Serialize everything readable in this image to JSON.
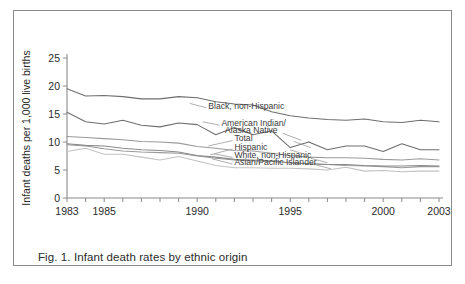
{
  "figure": {
    "caption": "Fig. 1. Infant death rates by ethnic origin",
    "border_color": "#8a8a8a"
  },
  "chart_data": {
    "type": "line",
    "title": "",
    "xlabel": "",
    "ylabel": "Infant deaths per 1,000 live births",
    "xlim": [
      1983,
      2003
    ],
    "ylim": [
      0,
      25
    ],
    "grid": false,
    "legend": "inline-labels",
    "y_ticks": [
      0,
      5,
      10,
      15,
      20,
      25
    ],
    "x_ticks": [
      1983,
      1984,
      1985,
      1986,
      1987,
      1988,
      1989,
      1990,
      1991,
      1992,
      1993,
      1994,
      1995,
      1996,
      1997,
      1998,
      1999,
      2000,
      2001,
      2002,
      2003
    ],
    "x_tick_labels": [
      "1983",
      "",
      "1985",
      "",
      "",
      "",
      "",
      "1990",
      "",
      "",
      "",
      "",
      "1995",
      "",
      "",
      "",
      "",
      "2000",
      "",
      "",
      "2003"
    ],
    "x": [
      1983,
      1984,
      1985,
      1986,
      1987,
      1988,
      1989,
      1990,
      1991,
      1992,
      1993,
      1994,
      1995,
      1996,
      1997,
      1998,
      1999,
      2000,
      2001,
      2002,
      2003
    ],
    "series": [
      {
        "name": "Black, non-Hispanic",
        "color": "#6e6e6e",
        "label_x": 1990.6,
        "label_y": 15.9,
        "values": [
          19.5,
          18.2,
          18.3,
          18.1,
          17.7,
          17.7,
          18.1,
          17.9,
          17.2,
          16.8,
          16.6,
          15.4,
          14.7,
          14.3,
          14.0,
          13.9,
          14.1,
          13.6,
          13.5,
          13.9,
          13.6
        ]
      },
      {
        "name": "American Indian/",
        "name2": "Alaska Native",
        "color": "#6e6e6e",
        "label_x": 1991.3,
        "label_y": 12.8,
        "label2_x": 1991.5,
        "label2_y": 11.6,
        "values": [
          15.3,
          13.6,
          13.2,
          13.9,
          13.0,
          12.7,
          13.4,
          13.1,
          11.3,
          12.6,
          11.3,
          12.0,
          9.0,
          10.0,
          8.6,
          9.3,
          9.3,
          8.3,
          9.7,
          8.6,
          8.6
        ]
      },
      {
        "name": "Total",
        "color": "#9a9a9a",
        "label_x": 1992.0,
        "label_y": 10.1,
        "values": [
          11.0,
          10.8,
          10.6,
          10.4,
          10.1,
          10.0,
          9.8,
          9.2,
          8.9,
          8.5,
          8.4,
          8.0,
          7.6,
          7.3,
          7.2,
          7.2,
          7.1,
          6.9,
          6.8,
          7.0,
          6.8
        ]
      },
      {
        "name": "Hispanic",
        "color": "#9a9a9a",
        "label_x": 1992.0,
        "label_y": 8.6,
        "values": [
          9.5,
          9.3,
          8.8,
          8.4,
          8.2,
          8.1,
          8.0,
          7.5,
          7.1,
          6.8,
          6.6,
          6.5,
          6.3,
          6.1,
          6.0,
          5.8,
          5.7,
          5.6,
          5.4,
          5.6,
          5.6
        ]
      },
      {
        "name": "White, non-Hispanic",
        "color": "#8a8a8a",
        "label_x": 1992.0,
        "label_y": 7.1,
        "values": [
          9.7,
          9.4,
          9.3,
          8.9,
          8.6,
          8.5,
          8.2,
          7.6,
          7.3,
          6.9,
          6.8,
          6.6,
          6.3,
          6.1,
          6.0,
          6.0,
          5.8,
          5.7,
          5.7,
          5.8,
          5.7
        ]
      },
      {
        "name": "Asian/Pacific Islander",
        "color": "#c2c2c2",
        "label_x": 1992.0,
        "label_y": 5.9,
        "values": [
          8.3,
          8.9,
          7.8,
          7.8,
          7.3,
          6.8,
          7.4,
          6.6,
          5.8,
          5.4,
          5.4,
          5.3,
          5.3,
          5.2,
          5.0,
          5.5,
          4.8,
          4.9,
          4.7,
          4.8,
          4.8
        ]
      }
    ]
  }
}
